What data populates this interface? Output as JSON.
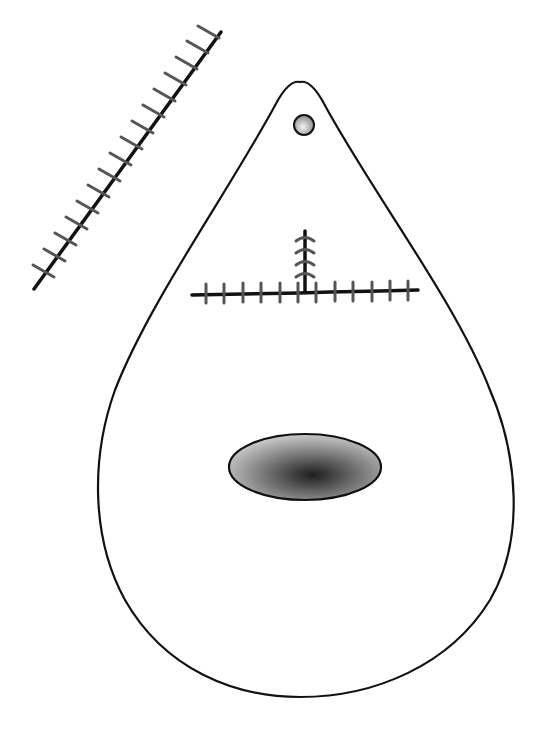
{
  "diagram": {
    "type": "surgical-flap-illustration",
    "background": "#ffffff",
    "stroke_color": "#111111",
    "suture_color": "#555555",
    "flap": {
      "shape": "teardrop",
      "apex": [
        300,
        82
      ],
      "bottom": [
        300,
        697
      ],
      "left_extent": 95,
      "right_extent": 513
    },
    "pivot_hole": {
      "cx": 304,
      "cy": 125,
      "r": 10
    },
    "lesion": {
      "cx": 305,
      "cy": 467,
      "rx": 76,
      "ry": 33,
      "fill_center": "#222222",
      "fill_edge": "#bbbbbb"
    },
    "horizontal_suture_line": {
      "x1": 192,
      "y1": 293,
      "x2": 418,
      "y2": 290,
      "stitch_count": 12
    },
    "vertical_suture_line": {
      "x1": 305,
      "y1": 230,
      "x2": 305,
      "y2": 292,
      "stitch_count": 4
    },
    "donor_suture_line": {
      "x1": 33,
      "y1": 289,
      "x2": 221,
      "y2": 31,
      "stitch_count": 17
    }
  }
}
